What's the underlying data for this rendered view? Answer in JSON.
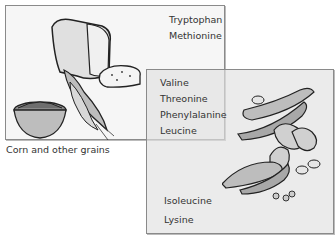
{
  "grains_box": {
    "amino_acids": [
      "Tryptophan",
      "Methionine"
    ],
    "caption": "Corn and other grains",
    "illustration": "bread-corn-bowl-of-grains"
  },
  "legumes_box": {
    "amino_acids_top": [
      "Valine",
      "Threonine",
      "Phenylalanine",
      "Leucine"
    ],
    "amino_acids_bottom": [
      "Isoleucine",
      "Lysine"
    ],
    "illustration": "pea-pods-peanuts-beans"
  },
  "colors": {
    "border": "#8a8a8a",
    "grains_bg": "#f6f6f6",
    "legumes_bg": "#e1e1e1",
    "overlap_bg": "#d4d4d4"
  }
}
